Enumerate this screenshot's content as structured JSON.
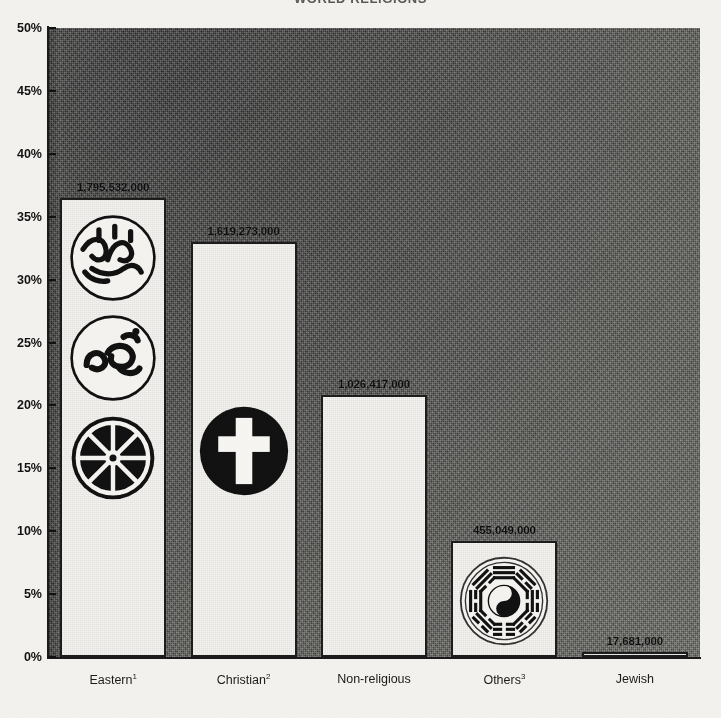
{
  "chart_data": {
    "type": "bar",
    "title": "WORLD RELIGIONS",
    "xlabel": "",
    "ylabel": "",
    "ylim": [
      0,
      50
    ],
    "y_tick_suffix": "%",
    "y_ticks": [
      "50%",
      "45%",
      "40%",
      "35%",
      "30%",
      "25%",
      "20%",
      "15%",
      "10%",
      "5%",
      "0%"
    ],
    "y_tick_values": [
      50,
      45,
      40,
      35,
      30,
      25,
      20,
      15,
      10,
      5,
      0
    ],
    "grid": false,
    "legend": "none",
    "categories": [
      "Eastern",
      "Christian",
      "Non-religious",
      "Others",
      "Jewish"
    ],
    "category_footnotes": [
      "1",
      "2",
      "",
      "3",
      ""
    ],
    "category_labels": [
      "Eastern¹",
      "Christian²",
      "Non-religious",
      "Others³",
      "Jewish"
    ],
    "values": [
      36.5,
      33.0,
      20.8,
      9.2,
      0.4
    ],
    "data_labels": [
      "1,795,532,000",
      "1,619,273,000",
      "1,026,417,000",
      "455,049,000",
      "17,681,000"
    ],
    "adherents": [
      1795532000,
      1619273000,
      1026417000,
      455049000,
      17681000
    ],
    "symbols": [
      [
        "islamic-crescent-calligraphy-icon",
        "om-icon",
        "dharma-wheel-icon"
      ],
      [
        "christian-cross-icon"
      ],
      [],
      [
        "bagua-yinyang-icon"
      ],
      [
        "star-of-david-icon"
      ]
    ]
  },
  "style": {
    "bar_fill": "#f4f3ef",
    "bar_border": "#1c1c1c",
    "plot_background": "#5a5a56",
    "axis_color": "#1a1a1a",
    "text_color": "#111111",
    "page_background": "#f2f1ee"
  }
}
